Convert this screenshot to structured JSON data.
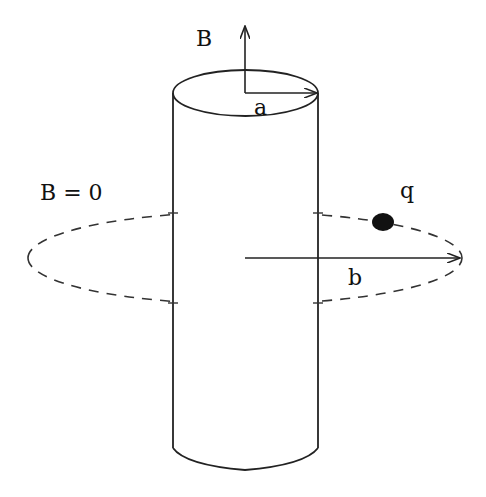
{
  "diagram": {
    "title": "",
    "labels": {
      "B_field": "B",
      "radius_a": "a",
      "outside_field": "B = 0",
      "charge": "q",
      "radius_b": "b"
    },
    "elements": {
      "cylinder": {
        "center_x": 245,
        "top_y": 93,
        "bottom_y": 448,
        "radius_x": 72,
        "radius_y": 23
      },
      "orbit": {
        "center_x": 245,
        "center_y": 258,
        "radius_x": 217,
        "radius_y": 46,
        "style": "dashed"
      },
      "charge_dot": {
        "x": 383,
        "y": 222,
        "r": 10
      },
      "arrow_B": {
        "from": [
          245,
          70
        ],
        "to": [
          245,
          26
        ]
      },
      "arrow_a": {
        "from": [
          245,
          93
        ],
        "to": [
          317,
          93
        ]
      },
      "arrow_b": {
        "from": [
          245,
          258
        ],
        "to": [
          460,
          258
        ]
      }
    },
    "colors": {
      "stroke": "#222222",
      "background": "#ffffff"
    }
  }
}
